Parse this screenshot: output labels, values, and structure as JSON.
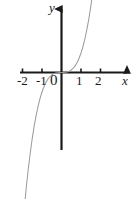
{
  "figure": {
    "background_color": "#ffffff",
    "axis_color": "#1a1a1a",
    "curve_color": "#9a9a9a"
  },
  "axes": {
    "x_label": "x",
    "y_label": "y",
    "x_ticks": [
      {
        "value": -2,
        "label": "-2"
      },
      {
        "value": -1,
        "label": "-1"
      },
      {
        "value": 0,
        "label": "0"
      },
      {
        "value": 1,
        "label": "1"
      },
      {
        "value": 2,
        "label": "2"
      }
    ]
  },
  "chart_data": {
    "type": "line",
    "title": "",
    "xlabel": "x",
    "ylabel": "y",
    "xlim": [
      -2.1,
      3.5
    ],
    "ylim": [
      -3.9,
      3.45
    ],
    "grid": false,
    "legend": false,
    "xticks": [
      -2,
      -1,
      0,
      1,
      2
    ],
    "yticks": [],
    "series": [
      {
        "name": "y = x^3",
        "color": "#9a9a9a",
        "x": [
          -2.1,
          -2.0,
          -1.9,
          -1.8,
          -1.7,
          -1.6,
          -1.5,
          -1.4,
          -1.3,
          -1.2,
          -1.1,
          -1.0,
          -0.9,
          -0.8,
          -0.7,
          -0.6,
          -0.5,
          -0.4,
          -0.3,
          -0.2,
          -0.1,
          0.0,
          0.1,
          0.2,
          0.3,
          0.4,
          0.5,
          0.6,
          0.7,
          0.8,
          0.9,
          1.0,
          1.1,
          1.2,
          1.3,
          1.4,
          1.5,
          1.55
        ],
        "y": [
          -9.26,
          -8.0,
          -6.86,
          -5.83,
          -4.91,
          -4.1,
          -3.38,
          -2.74,
          -2.2,
          -1.73,
          -1.33,
          -1.0,
          -0.73,
          -0.51,
          -0.34,
          -0.22,
          -0.13,
          -0.06,
          -0.03,
          -0.01,
          0.0,
          0.0,
          0.0,
          0.01,
          0.03,
          0.06,
          0.13,
          0.22,
          0.34,
          0.51,
          0.73,
          1.0,
          1.33,
          1.73,
          2.2,
          2.74,
          3.38,
          3.72
        ]
      }
    ]
  }
}
